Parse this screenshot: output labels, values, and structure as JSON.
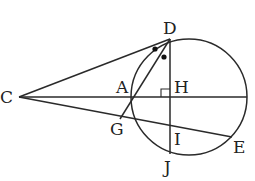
{
  "diagram": {
    "type": "geometry",
    "stroke_color": "#2a2a2a",
    "points": {
      "C": {
        "label": "C",
        "x": 19,
        "y": 97
      },
      "D": {
        "label": "D",
        "x": 170,
        "y": 39
      },
      "A": {
        "label": "A",
        "x": 132,
        "y": 97
      },
      "H": {
        "label": "H",
        "x": 170,
        "y": 97
      },
      "G": {
        "label": "G",
        "x": 122,
        "y": 117
      },
      "I": {
        "label": "I",
        "x": 170,
        "y": 124
      },
      "J": {
        "label": "J",
        "x": 170,
        "y": 154
      },
      "E": {
        "label": "E",
        "x": 232,
        "y": 137
      }
    },
    "circle": {
      "cx": 189,
      "cy": 97,
      "r": 58
    },
    "segments": [
      [
        "C",
        "D"
      ],
      [
        "C",
        "H"
      ],
      [
        "C",
        "E"
      ],
      [
        "D",
        "J"
      ],
      [
        "D",
        "G"
      ]
    ],
    "marks": {
      "right_angle_at": "H",
      "equal_angle_dots": 2
    }
  }
}
